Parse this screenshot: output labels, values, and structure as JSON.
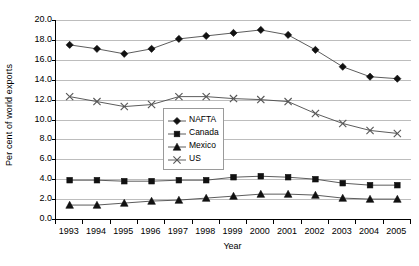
{
  "chart_data": {
    "type": "line",
    "title": "",
    "xlabel": "Year",
    "ylabel": "Per cent of world exports",
    "categories": [
      "1993",
      "1994",
      "1995",
      "1996",
      "1997",
      "1998",
      "1999",
      "2000",
      "2001",
      "2002",
      "2003",
      "2004",
      "2005"
    ],
    "ylim": [
      0.0,
      20.0
    ],
    "ytick_step": 2.0,
    "yticks": [
      "20.0",
      "18.0",
      "16.0",
      "14.0",
      "12.0",
      "10.0",
      "8.0",
      "6.0",
      "4.0",
      "2.0",
      "0.0"
    ],
    "grid": true,
    "legend_position": "center",
    "series": [
      {
        "name": "NAFTA",
        "marker": "diamond",
        "color": "#111111",
        "values": [
          17.5,
          17.1,
          16.6,
          17.1,
          18.1,
          18.4,
          18.7,
          19.0,
          18.5,
          17.0,
          15.3,
          14.3,
          14.1
        ]
      },
      {
        "name": "Canada",
        "marker": "square",
        "color": "#111111",
        "values": [
          3.9,
          3.9,
          3.8,
          3.8,
          3.9,
          3.9,
          4.2,
          4.3,
          4.2,
          4.0,
          3.6,
          3.4,
          3.4
        ]
      },
      {
        "name": "Mexico",
        "marker": "triangle",
        "color": "#111111",
        "values": [
          1.4,
          1.4,
          1.6,
          1.8,
          1.9,
          2.1,
          2.3,
          2.5,
          2.5,
          2.4,
          2.1,
          2.0,
          2.0
        ]
      },
      {
        "name": "US",
        "marker": "cross",
        "color": "#555555",
        "values": [
          12.3,
          11.8,
          11.3,
          11.5,
          12.3,
          12.3,
          12.1,
          12.0,
          11.8,
          10.6,
          9.6,
          8.9,
          8.6
        ]
      }
    ]
  }
}
